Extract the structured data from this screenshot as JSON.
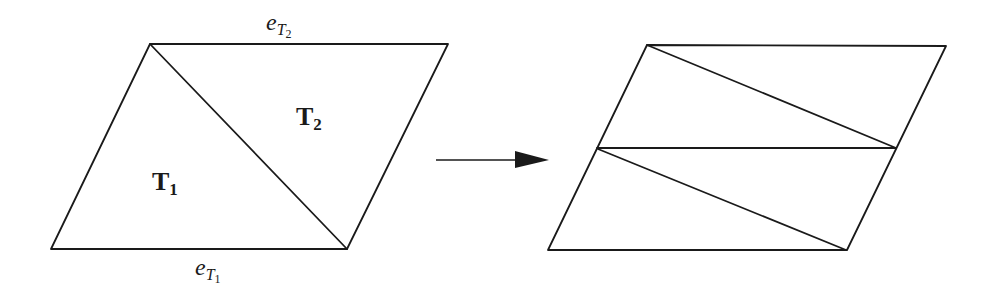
{
  "figure": {
    "before": {
      "name": "parallelogram split into two triangles",
      "vertices": {
        "top_left": [
          150,
          44
        ],
        "top_right": [
          448,
          44
        ],
        "bottom_right": [
          347,
          249
        ],
        "bottom_left": [
          51,
          249
        ]
      },
      "diagonal": [
        [
          150,
          44
        ],
        [
          347,
          249
        ]
      ],
      "regions": [
        {
          "id": "T1",
          "label_main": "T",
          "label_sub": "1",
          "pos": [
            152,
            190
          ]
        },
        {
          "id": "T2",
          "label_main": "T",
          "label_sub": "2",
          "pos": [
            296,
            125
          ]
        }
      ],
      "edge_labels": [
        {
          "id": "eT2",
          "main": "e",
          "sub_main": "T",
          "sub_sub": "2",
          "pos": [
            265,
            32
          ],
          "edge": "top"
        },
        {
          "id": "eT1",
          "main": "e",
          "sub_main": "T",
          "sub_sub": "1",
          "pos": [
            194,
            278
          ],
          "edge": "bottom"
        }
      ]
    },
    "arrow": {
      "from": [
        436,
        160
      ],
      "to": [
        549,
        160
      ],
      "color": "#1a1a1a"
    },
    "after": {
      "name": "parallelogram split into two stacked parallelograms each with a diagonal",
      "outline": [
        [
          647,
          45
        ],
        [
          946,
          46
        ],
        [
          847,
          250
        ],
        [
          548,
          250
        ]
      ],
      "middle_line": [
        [
          597,
          148
        ],
        [
          896,
          148
        ]
      ],
      "diagonals": [
        [
          [
            647,
            45
          ],
          [
            896,
            148
          ]
        ],
        [
          [
            598,
            149
          ],
          [
            846,
            250
          ]
        ]
      ]
    }
  }
}
